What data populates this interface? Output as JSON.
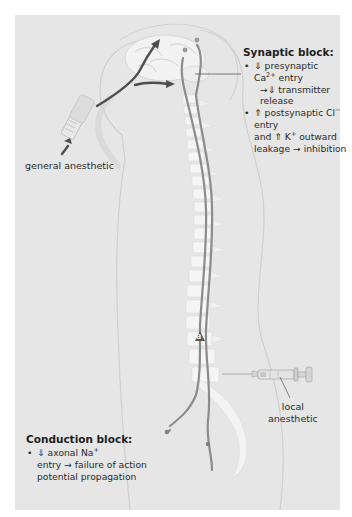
{
  "diagram": {
    "background_color": "#e6e6e6",
    "nerve_color": "#8c8c8c",
    "arrow_color": "#555555",
    "labels": {
      "general_anesthetic": "general anesthetic",
      "local_anesthetic_line1": "local",
      "local_anesthetic_line2": "anesthetic",
      "marker": "a"
    },
    "synaptic_block": {
      "title": "Synaptic block:",
      "bullets": [
        {
          "arrow1": "⇓",
          "text1": " presynaptic",
          "ion": "Ca",
          "ion_sup": "2+",
          "text2": " entry",
          "cont_arrow": "→⇓",
          "cont_text": " transmitter release"
        },
        {
          "arrow1": "⇑",
          "text1": " postsynaptic ",
          "ion": "Cl",
          "ion_sup": "−",
          "text2": " entry",
          "line2_a": "and ",
          "arrow2": "⇑",
          "line2_b": " K",
          "ion2_sup": "+",
          "line2_c": " outward",
          "line3": "leakage → inhibition"
        }
      ]
    },
    "conduction_block": {
      "title": "Conduction block:",
      "bullets": [
        {
          "arrow1": "⇓",
          "text1": " axonal Na",
          "ion_sup": "+",
          "line2": "entry → failure of action",
          "line3": "potential propagation"
        }
      ]
    }
  }
}
